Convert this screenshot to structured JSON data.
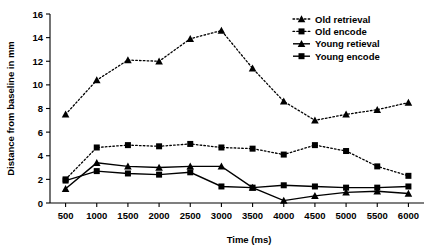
{
  "chart_data": {
    "type": "line",
    "title": "",
    "xlabel": "Time (ms)",
    "ylabel": "Distance from baseline in mm",
    "x": [
      500,
      1000,
      1500,
      2000,
      2500,
      3000,
      3500,
      4000,
      4500,
      5000,
      5500,
      6000
    ],
    "xtick_labels": [
      "500",
      "1000",
      "1500",
      "2000",
      "2500",
      "3000",
      "3500",
      "4000",
      "4500",
      "5000",
      "5500",
      "6000"
    ],
    "ytick_labels": [
      "0",
      "2",
      "4",
      "6",
      "8",
      "10",
      "12",
      "14",
      "16"
    ],
    "ytick_values": [
      0,
      2,
      4,
      6,
      8,
      10,
      12,
      14,
      16
    ],
    "xlim": [
      250,
      6250
    ],
    "ylim": [
      0,
      16
    ],
    "grid": false,
    "legend_position": "top-right",
    "series": [
      {
        "name": "Old retrieval",
        "marker": "triangle",
        "linestyle": "dotted",
        "color": "#000000",
        "values": [
          7.5,
          10.4,
          12.1,
          12.0,
          13.9,
          14.6,
          11.4,
          8.6,
          7.0,
          7.5,
          7.9,
          8.5
        ]
      },
      {
        "name": "Old encode",
        "marker": "square",
        "linestyle": "dotted",
        "color": "#000000",
        "values": [
          2.0,
          4.7,
          4.9,
          4.8,
          5.0,
          4.7,
          4.6,
          4.1,
          4.9,
          4.4,
          3.1,
          2.3
        ]
      },
      {
        "name": "Young retieval",
        "marker": "triangle",
        "linestyle": "solid",
        "color": "#000000",
        "values": [
          1.2,
          3.4,
          3.1,
          3.0,
          3.1,
          3.1,
          1.3,
          0.2,
          0.6,
          0.9,
          1.0,
          0.8
        ]
      },
      {
        "name": "Young encode",
        "marker": "square",
        "linestyle": "solid",
        "color": "#000000",
        "values": [
          1.9,
          2.7,
          2.5,
          2.4,
          2.6,
          1.4,
          1.3,
          1.5,
          1.4,
          1.3,
          1.3,
          1.4
        ]
      }
    ]
  }
}
